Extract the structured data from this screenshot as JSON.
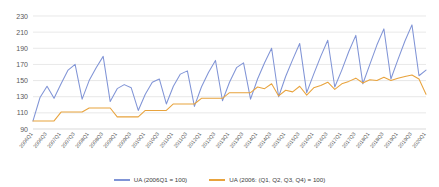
{
  "chart_data": {
    "type": "line",
    "title": "",
    "xlabel": "",
    "ylabel": "",
    "ylim": [
      90,
      230
    ],
    "ytick_values": [
      90,
      110,
      130,
      150,
      170,
      190,
      210,
      230
    ],
    "grid": true,
    "legend_position": "bottom",
    "x": [
      "2006Q1",
      "2006Q2",
      "2006Q3",
      "2006Q4",
      "2007Q1",
      "2007Q2",
      "2007Q3",
      "2007Q4",
      "2008Q1",
      "2008Q2",
      "2008Q3",
      "2008Q4",
      "2009Q1",
      "2009Q2",
      "2009Q3",
      "2009Q4",
      "2010Q1",
      "2010Q2",
      "2010Q3",
      "2010Q4",
      "2011Q1",
      "2011Q2",
      "2011Q3",
      "2011Q4",
      "2012Q1",
      "2012Q2",
      "2012Q3",
      "2012Q4",
      "2013Q1",
      "2013Q2",
      "2013Q3",
      "2013Q4",
      "2014Q1",
      "2014Q2",
      "2014Q3",
      "2014Q4",
      "2015Q1",
      "2015Q2",
      "2015Q3",
      "2015Q4",
      "2016Q1",
      "2016Q2",
      "2016Q3",
      "2016Q4",
      "2017Q1",
      "2017Q2",
      "2017Q3",
      "2017Q4",
      "2018Q1",
      "2018Q2",
      "2018Q3",
      "2018Q4",
      "2019Q1",
      "2019Q2",
      "2019Q3",
      "2019Q4",
      "2020Q1"
    ],
    "xtick_labels": [
      "2006Q1",
      "2006Q3",
      "2007Q1",
      "2007Q3",
      "2008Q1",
      "2008Q3",
      "2009Q1",
      "2009Q3",
      "2010Q1",
      "2010Q3",
      "2011Q1",
      "2011Q3",
      "2012Q1",
      "2012Q3",
      "2013Q1",
      "2013Q3",
      "2014Q1",
      "2014Q3",
      "2015Q1",
      "2015Q3",
      "2016Q1",
      "2016Q3",
      "2017Q1",
      "2017Q3",
      "2018Q1",
      "2018Q3",
      "2019Q1",
      "2019Q3",
      "2020Q1"
    ],
    "series": [
      {
        "name": "UA (2006Q1 = 100)",
        "color": "#8094d6",
        "values": [
          100,
          129,
          143,
          128,
          146,
          163,
          170,
          127,
          150,
          166,
          180,
          124,
          140,
          145,
          141,
          113,
          133,
          148,
          152,
          121,
          143,
          158,
          162,
          118,
          142,
          160,
          175,
          125,
          148,
          166,
          172,
          127,
          152,
          172,
          190,
          130,
          155,
          176,
          196,
          135,
          158,
          180,
          200,
          142,
          163,
          186,
          206,
          146,
          170,
          194,
          214,
          152,
          176,
          199,
          219,
          156,
          163
        ]
      },
      {
        "name": "UA (2006: (Q1, Q2, Q3, Q4) = 100)",
        "color": "#e8a33d",
        "values": [
          100,
          100,
          100,
          100,
          111,
          111,
          111,
          111,
          116,
          116,
          116,
          116,
          105,
          105,
          105,
          105,
          113,
          113,
          113,
          113,
          121,
          121,
          121,
          121,
          128,
          128,
          128,
          128,
          135,
          135,
          135,
          135,
          142,
          140,
          146,
          131,
          138,
          136,
          143,
          132,
          141,
          144,
          148,
          139,
          146,
          149,
          153,
          147,
          151,
          150,
          154,
          150,
          153,
          155,
          157,
          152,
          133
        ]
      }
    ]
  },
  "legend": {
    "items": [
      {
        "label": "UA (2006Q1 = 100)",
        "color": "#8094d6"
      },
      {
        "label": "UA (2006: (Q1, Q2, Q3, Q4) = 100)",
        "color": "#e8a33d"
      }
    ]
  }
}
